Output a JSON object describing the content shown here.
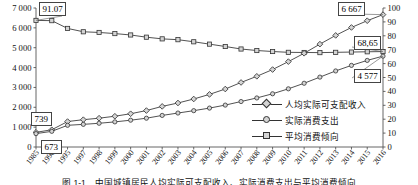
{
  "chart_data": {
    "type": "line",
    "title": "",
    "xlabel": "",
    "ylabel_left": "",
    "ylabel_right": "",
    "grid": false,
    "legend_position": "inside-right",
    "categories": [
      "1985",
      "1990",
      "1995",
      "1997",
      "1998",
      "1999",
      "2000",
      "2001",
      "2002",
      "2003",
      "2004",
      "2005",
      "2006",
      "2007",
      "2008",
      "2009",
      "2010",
      "2011",
      "2012",
      "2013",
      "2014",
      "2015",
      "2016"
    ],
    "y_left_ticks": [
      "0",
      "1 000",
      "2 000",
      "3 000",
      "4 000",
      "5 000",
      "6 000",
      "7 000"
    ],
    "y_right_ticks": [
      "0",
      "10",
      "20",
      "30",
      "40",
      "50",
      "60",
      "70",
      "80",
      "90",
      "100"
    ],
    "ylim_left": [
      0,
      7000
    ],
    "ylim_right": [
      0,
      100
    ],
    "series": [
      {
        "name": "人均实际可支配收入",
        "axis": "left",
        "marker": "diamond",
        "values": [
          739,
          868,
          1281,
          1376,
          1451,
          1550,
          1675,
          1835,
          2045,
          2216,
          2418,
          2650,
          2920,
          3250,
          3560,
          3900,
          4300,
          4720,
          5180,
          5620,
          6020,
          6360,
          6667
        ]
      },
      {
        "name": "实际消费支出",
        "axis": "left",
        "marker": "circle",
        "values": [
          673,
          789,
          1093,
          1140,
          1195,
          1265,
          1350,
          1450,
          1590,
          1710,
          1830,
          1960,
          2110,
          2290,
          2470,
          2680,
          2930,
          3210,
          3520,
          3830,
          4110,
          4360,
          4577
        ]
      },
      {
        "name": "平均消费倾向",
        "axis": "right",
        "marker": "square",
        "values": [
          91.07,
          90.9,
          85.3,
          82.9,
          82.4,
          81.6,
          80.6,
          79.0,
          77.8,
          77.2,
          75.7,
          74.0,
          72.3,
          70.5,
          69.4,
          68.7,
          68.1,
          68.0,
          67.9,
          68.1,
          68.3,
          68.5,
          68.65
        ]
      }
    ],
    "annotations": [
      {
        "id": "apc-start",
        "text": "91.07",
        "series": "平均消费倾向",
        "point": "1985"
      },
      {
        "id": "income-start",
        "text": "739",
        "series": "人均实际可支配收入",
        "point": "1985"
      },
      {
        "id": "consum-start",
        "text": "673",
        "series": "实际消费支出",
        "point": "1985"
      },
      {
        "id": "income-end",
        "text": "6 667",
        "series": "人均实际可支配收入",
        "point": "2016"
      },
      {
        "id": "apc-end",
        "text": "68,65",
        "series": "平均消费倾向",
        "point": "2016"
      },
      {
        "id": "consum-end",
        "text": "4 577",
        "series": "实际消费支出",
        "point": "2016"
      }
    ],
    "colors": {
      "line": "#333333",
      "marker_fill": "#d4d4d4",
      "axis": "#555555",
      "text": "#111111"
    }
  },
  "figure": {
    "caption": "图 1-1　中国城镇居民人均实际可支配收入、实际消费支出与平均消费倾向"
  },
  "legend": {
    "items": [
      {
        "label": "人均实际可支配收入",
        "marker": "diamond"
      },
      {
        "label": "实际消费支出",
        "marker": "circle"
      },
      {
        "label": "平均消费倾向",
        "marker": "square"
      }
    ]
  }
}
